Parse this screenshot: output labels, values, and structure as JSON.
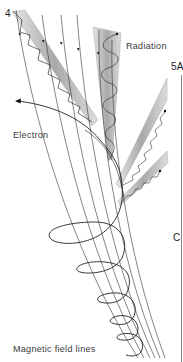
{
  "figure": {
    "labels": {
      "radiation": "Radiation",
      "electron": "Electron",
      "field_lines": "Magnetic field lines"
    },
    "panel_markers": {
      "top_left": "4",
      "right_top": "5A",
      "right_mid": "C"
    },
    "colors": {
      "line": "#2a2a2a",
      "beam_fill": "#b8b8b8",
      "label_text": "#3a3a3a"
    },
    "elements": {
      "field_line_count": 6,
      "radiation_beams": 4,
      "helix_turns_visible": 5
    }
  }
}
